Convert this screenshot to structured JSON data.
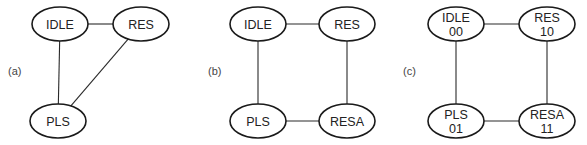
{
  "diagrams": [
    {
      "label": "(a)",
      "label_pos": [
        8,
        75
      ],
      "nodes": [
        {
          "id": "IDLE",
          "text": "IDLE",
          "sub": "",
          "x": 60,
          "y": 24
        },
        {
          "id": "RES",
          "text": "RES",
          "sub": "",
          "x": 141,
          "y": 24
        },
        {
          "id": "PLS",
          "text": "PLS",
          "sub": "",
          "x": 58,
          "y": 121
        }
      ],
      "edges": [
        [
          "IDLE",
          "RES"
        ],
        [
          "IDLE",
          "PLS"
        ],
        [
          "RES",
          "PLS"
        ]
      ]
    },
    {
      "label": "(b)",
      "label_pos": [
        208,
        75
      ],
      "nodes": [
        {
          "id": "IDLE",
          "text": "IDLE",
          "sub": "",
          "x": 258,
          "y": 24
        },
        {
          "id": "RES",
          "text": "RES",
          "sub": "",
          "x": 347,
          "y": 24
        },
        {
          "id": "PLS",
          "text": "PLS",
          "sub": "",
          "x": 258,
          "y": 121
        },
        {
          "id": "RESA",
          "text": "RESA",
          "sub": "",
          "x": 347,
          "y": 121
        }
      ],
      "edges": [
        [
          "IDLE",
          "RES"
        ],
        [
          "IDLE",
          "PLS"
        ],
        [
          "RES",
          "RESA"
        ],
        [
          "PLS",
          "RESA"
        ]
      ]
    },
    {
      "label": "(c)",
      "label_pos": [
        403,
        75
      ],
      "nodes": [
        {
          "id": "IDLE",
          "text": "IDLE",
          "sub": "00",
          "x": 456,
          "y": 24
        },
        {
          "id": "RES",
          "text": "RES",
          "sub": "10",
          "x": 547,
          "y": 24
        },
        {
          "id": "PLS",
          "text": "PLS",
          "sub": "01",
          "x": 456,
          "y": 121
        },
        {
          "id": "RESA",
          "text": "RESA",
          "sub": "11",
          "x": 547,
          "y": 121
        }
      ],
      "edges": [
        [
          "IDLE",
          "RES"
        ],
        [
          "IDLE",
          "PLS"
        ],
        [
          "RES",
          "RESA"
        ],
        [
          "PLS",
          "RESA"
        ]
      ]
    }
  ],
  "style": {
    "rx": 28,
    "ry": 17,
    "stroke": "#1a1a1a",
    "text_color": "#222222"
  }
}
